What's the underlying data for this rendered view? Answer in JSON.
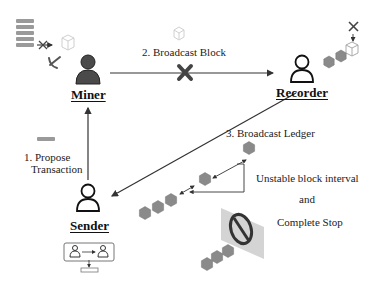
{
  "diagram": {
    "nodes": {
      "miner": {
        "label": "Miner",
        "icon": "user-filled-icon"
      },
      "recorder": {
        "label": "Recorder",
        "icon": "user-outline-icon"
      },
      "sender": {
        "label": "Sender",
        "icon": "user-outline-icon"
      }
    },
    "edges": {
      "propose": {
        "label_line1": "1. Propose",
        "label_line2": "Transaction",
        "from": "Sender",
        "to": "Miner"
      },
      "broadcast_block": {
        "label": "2. Broadcast Block",
        "from": "Miner",
        "to": "Recorder",
        "status": "blocked"
      },
      "broadcast_ledger": {
        "label": "3. Broadcast Ledger",
        "from": "Recorder",
        "to": "Sender"
      }
    },
    "annotations": {
      "line1": "Unstable block interval",
      "line2": "and",
      "line3": "Complete Stop"
    },
    "icons": [
      "ledger-stack-icon",
      "cross-icon",
      "cube-icon",
      "pickaxe-icon",
      "hexagon-block-icon",
      "no-entry-icon",
      "transaction-transfer-icon"
    ],
    "colors": {
      "line": "#333333",
      "block": "#8a8a8a",
      "cross": "#444444",
      "panel": "#d8d8d8"
    }
  }
}
